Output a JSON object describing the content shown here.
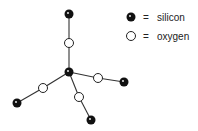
{
  "diagram": {
    "type": "molecular-structure",
    "colors": {
      "silicon": "#111111",
      "oxygen_fill": "#ffffff",
      "oxygen_stroke": "#222222",
      "bond": "#333333"
    },
    "atoms": [
      {
        "id": "si_center",
        "element": "silicon",
        "x": 69,
        "y": 72
      },
      {
        "id": "o_top",
        "element": "oxygen",
        "x": 69,
        "y": 43
      },
      {
        "id": "si_top",
        "element": "silicon",
        "x": 69,
        "y": 14
      },
      {
        "id": "o_right",
        "element": "oxygen",
        "x": 98,
        "y": 78
      },
      {
        "id": "si_right",
        "element": "silicon",
        "x": 124,
        "y": 82
      },
      {
        "id": "o_left",
        "element": "oxygen",
        "x": 43,
        "y": 88
      },
      {
        "id": "si_left",
        "element": "silicon",
        "x": 17,
        "y": 103
      },
      {
        "id": "o_bottom",
        "element": "oxygen",
        "x": 79,
        "y": 97
      },
      {
        "id": "si_bottom",
        "element": "silicon",
        "x": 91,
        "y": 120
      }
    ],
    "bonds": [
      [
        "si_center",
        "o_top"
      ],
      [
        "o_top",
        "si_top"
      ],
      [
        "si_center",
        "o_right"
      ],
      [
        "o_right",
        "si_right"
      ],
      [
        "si_center",
        "o_left"
      ],
      [
        "o_left",
        "si_left"
      ],
      [
        "si_center",
        "o_bottom"
      ],
      [
        "o_bottom",
        "si_bottom"
      ]
    ]
  },
  "legend": {
    "items": [
      {
        "symbol": "filled-circle",
        "equals": "=",
        "label": "silicon"
      },
      {
        "symbol": "open-circle",
        "equals": "=",
        "label": "oxygen"
      }
    ]
  }
}
